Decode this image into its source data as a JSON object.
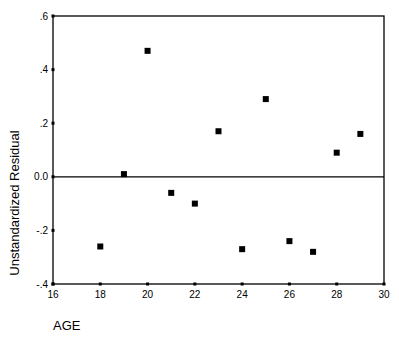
{
  "chart_data": {
    "type": "scatter",
    "title": "",
    "xlabel": "AGE",
    "ylabel": "Unstandardized Residual",
    "xlim": [
      16,
      30
    ],
    "ylim": [
      -0.4,
      0.6
    ],
    "x_ticks": [
      16,
      18,
      20,
      22,
      24,
      26,
      28,
      30
    ],
    "x_tick_labels": [
      "16",
      "18",
      "20",
      "22",
      "24",
      "26",
      "28",
      "30"
    ],
    "y_ticks": [
      -0.4,
      -0.2,
      0.0,
      0.2,
      0.4,
      0.6
    ],
    "y_tick_labels": [
      "-.4",
      "-.2",
      "0.0",
      ".2",
      ".4",
      ".6"
    ],
    "reference_line": {
      "axis": "y",
      "value": 0.0
    },
    "grid": false,
    "legend": null,
    "marker": "square",
    "marker_color": "#000000",
    "series": [
      {
        "name": "Unstandardized Residual",
        "x": [
          18,
          19,
          20,
          21,
          22,
          23,
          24,
          25,
          26,
          27,
          28,
          29
        ],
        "y": [
          -0.26,
          0.01,
          0.47,
          -0.06,
          -0.1,
          0.17,
          -0.27,
          0.29,
          -0.24,
          -0.28,
          0.09,
          0.16
        ]
      }
    ]
  }
}
